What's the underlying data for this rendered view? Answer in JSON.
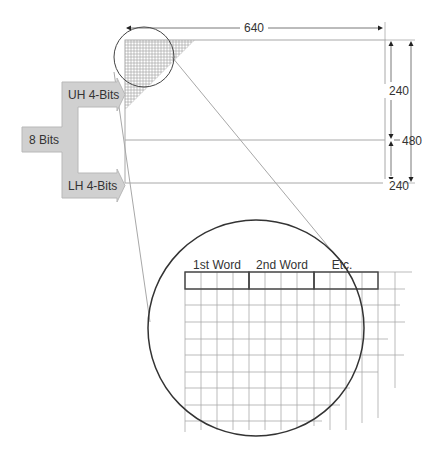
{
  "diagram": {
    "input_label": "8 Bits",
    "upper_label": "UH 4-Bits",
    "lower_label": "LH 4-Bits",
    "width_label": "640",
    "half_height_top_label": "240",
    "half_height_bottom_label": "240",
    "full_height_label": "480",
    "word_labels": [
      "1st Word",
      "2nd Word",
      "Etc."
    ]
  },
  "colors": {
    "arrow_fill": "#d0d0d0",
    "arrow_stroke": "#b8b8b8",
    "line": "#a8a8a8",
    "grid": "#b0b0b0",
    "circle": "#333333",
    "text": "#333333"
  }
}
